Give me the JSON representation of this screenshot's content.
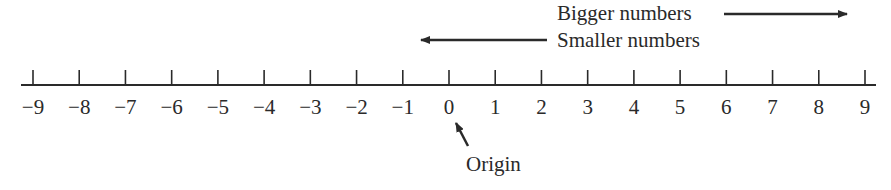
{
  "diagram": {
    "type": "number-line",
    "range": [
      -9,
      9
    ],
    "ticks": [
      -9,
      -8,
      -7,
      -6,
      -5,
      -4,
      -3,
      -2,
      -1,
      0,
      1,
      2,
      3,
      4,
      5,
      6,
      7,
      8,
      9
    ],
    "tick_labels": [
      "−9",
      "−8",
      "−7",
      "−6",
      "−5",
      "−4",
      "−3",
      "−2",
      "−1",
      "0",
      "1",
      "2",
      "3",
      "4",
      "5",
      "6",
      "7",
      "8",
      "9"
    ],
    "annotations": {
      "bigger": "Bigger numbers",
      "smaller": "Smaller numbers",
      "origin": "Origin"
    },
    "colors": {
      "ink": "#2a2a2a",
      "background": "#ffffff"
    }
  }
}
